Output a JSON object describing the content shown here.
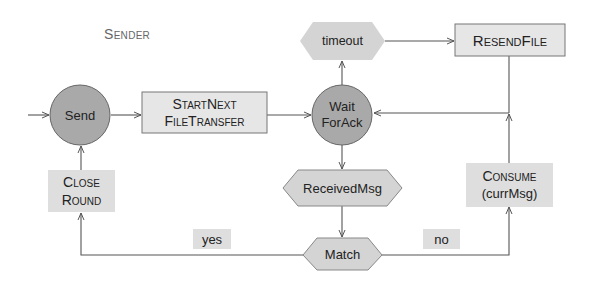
{
  "diagram": {
    "title": "Sender",
    "colors": {
      "state_fill": "#a9a9a9",
      "box_fill": "#e6e6e6",
      "event_fill": "#d4d4d4",
      "line": "#555555",
      "text": "#222222",
      "title": "#666666"
    },
    "nodes": {
      "send": {
        "type": "state",
        "label": "Send"
      },
      "start_next": {
        "type": "action",
        "line1": "StartNext",
        "line2": "FileTransfer"
      },
      "wait_for_ack": {
        "type": "state",
        "line1": "Wait",
        "line2": "ForAck"
      },
      "timeout": {
        "type": "event",
        "label": "timeout"
      },
      "resend_file": {
        "type": "action",
        "label": "ResendFile"
      },
      "received_msg": {
        "type": "event",
        "label": "ReceivedMsg"
      },
      "match": {
        "type": "decision",
        "label": "Match"
      },
      "close_round": {
        "type": "action",
        "line1": "Close",
        "line2": "Round"
      },
      "consume": {
        "type": "action",
        "line1": "Consume",
        "line2": "(currMsg)"
      }
    },
    "edge_labels": {
      "yes": "yes",
      "no": "no"
    },
    "edges": [
      [
        "entry",
        "send"
      ],
      [
        "send",
        "start_next"
      ],
      [
        "start_next",
        "wait_for_ack"
      ],
      [
        "wait_for_ack",
        "timeout"
      ],
      [
        "timeout",
        "resend_file"
      ],
      [
        "resend_file",
        "wait_for_ack"
      ],
      [
        "wait_for_ack",
        "received_msg"
      ],
      [
        "received_msg",
        "match"
      ],
      [
        "match",
        "close_round",
        "yes"
      ],
      [
        "match",
        "consume",
        "no"
      ],
      [
        "consume",
        "wait_for_ack"
      ],
      [
        "close_round",
        "send"
      ]
    ]
  }
}
